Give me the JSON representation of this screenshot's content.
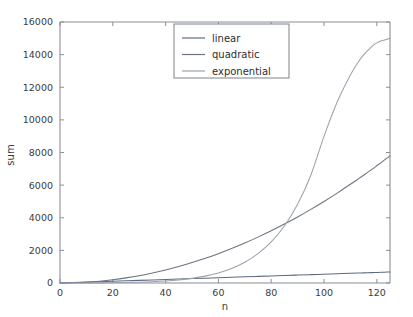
{
  "chart_data": {
    "type": "line",
    "title": "",
    "xlabel": "n",
    "ylabel": "sum",
    "xlim": [
      0,
      125
    ],
    "ylim": [
      0,
      16000
    ],
    "grid": false,
    "legend_position": "upper center",
    "xticks": [
      0,
      20,
      40,
      60,
      80,
      100,
      120
    ],
    "xtick_labels": [
      "0",
      "20",
      "40",
      "60",
      "80",
      "100",
      "120"
    ],
    "yticks": [
      0,
      2000,
      4000,
      6000,
      8000,
      10000,
      12000,
      14000,
      16000
    ],
    "ytick_labels": [
      "0",
      "2000",
      "4000",
      "6000",
      "8000",
      "10000",
      "12000",
      "14000",
      "16000"
    ],
    "x": [
      0,
      5,
      10,
      15,
      20,
      25,
      30,
      35,
      40,
      45,
      50,
      55,
      60,
      65,
      70,
      75,
      80,
      85,
      90,
      95,
      100,
      105,
      110,
      113,
      115,
      118,
      120,
      122,
      124,
      125
    ],
    "series": [
      {
        "name": "linear",
        "color": "#5b6b80",
        "values": [
          0,
          27,
          54,
          81,
          108,
          135,
          162,
          189,
          216,
          243,
          270,
          297,
          324,
          351,
          378,
          405,
          432,
          459,
          486,
          513,
          540,
          567,
          594,
          610,
          621,
          637,
          648,
          659,
          670,
          675
        ]
      },
      {
        "name": "quadratic",
        "color": "#6b7380",
        "values": [
          0,
          13,
          50,
          113,
          200,
          313,
          450,
          613,
          800,
          1013,
          1250,
          1513,
          1800,
          2113,
          2450,
          2813,
          3200,
          3613,
          4050,
          4513,
          5000,
          5513,
          6050,
          6382,
          6608,
          6952,
          7188,
          7428,
          7672,
          7795
        ]
      },
      {
        "name": "exponential",
        "color": "#9aa2ad",
        "values": [
          0,
          1,
          3,
          7,
          14,
          26,
          45,
          75,
          120,
          186,
          283,
          421,
          617,
          891,
          1272,
          1797,
          2516,
          3495,
          4821,
          6605,
          8990,
          11095,
          12750,
          13550,
          13980,
          14480,
          14720,
          14860,
          14950,
          14990
        ]
      }
    ],
    "legend_entries": [
      {
        "label": "linear",
        "color": "#5b6b80"
      },
      {
        "label": "quadratic",
        "color": "#6b7380"
      },
      {
        "label": "exponential",
        "color": "#9aa2ad"
      }
    ]
  },
  "axes": {
    "spine_color": "#8a8f96",
    "background": "#ffffff"
  }
}
